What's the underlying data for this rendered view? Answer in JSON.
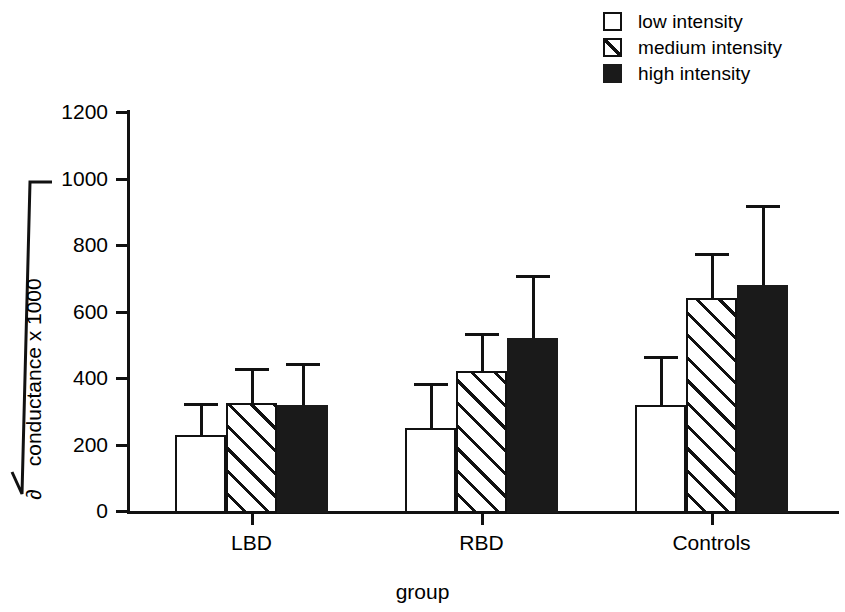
{
  "legend": {
    "items": [
      {
        "label": "low intensity",
        "swatch": "open-square-icon"
      },
      {
        "label": "medium intensity",
        "swatch": "hatched-square-icon"
      },
      {
        "label": "high intensity",
        "swatch": "filled-square-icon"
      }
    ]
  },
  "axes": {
    "y_title_radical": "√",
    "y_title_symbol": "∂",
    "y_title_text": "conductance x 1000",
    "x_title": "group",
    "y_ticks": [
      "0",
      "200",
      "400",
      "600",
      "800",
      "1000",
      "1200"
    ]
  },
  "chart_data": {
    "type": "bar",
    "title": "",
    "xlabel": "group",
    "ylabel": "√ ∂ conductance x 1000",
    "ylim": [
      0,
      1200
    ],
    "ytick_step": 200,
    "grid": false,
    "legend_position": "top-right",
    "error_bars": "upper only (SD)",
    "categories": [
      "LBD",
      "RBD",
      "Controls"
    ],
    "series": [
      {
        "name": "low intensity",
        "values": [
          230,
          250,
          320
        ],
        "errors_upper": [
          325,
          385,
          465
        ],
        "fill": "open"
      },
      {
        "name": "medium intensity",
        "values": [
          325,
          420,
          640
        ],
        "errors_upper": [
          430,
          535,
          775
        ],
        "fill": "hatched"
      },
      {
        "name": "high intensity",
        "values": [
          320,
          520,
          680
        ],
        "errors_upper": [
          445,
          710,
          920
        ],
        "fill": "solid"
      }
    ]
  }
}
